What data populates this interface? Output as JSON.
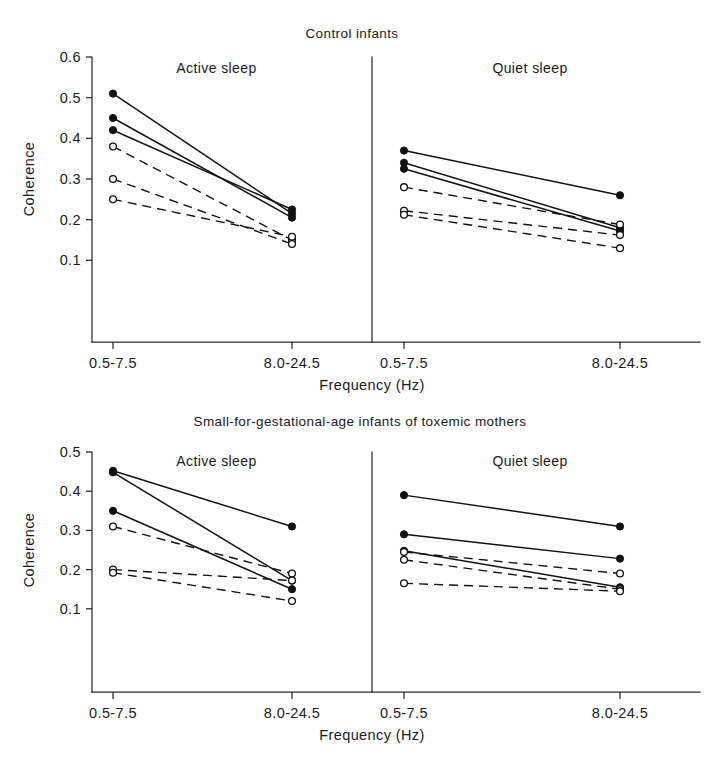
{
  "figure": {
    "axis_y_label": "Coherence",
    "axis_x_label": "Frequency (Hz)",
    "x_categories": [
      "0.5-7.5",
      "8.0-24.5"
    ],
    "caption": ""
  },
  "charts": [
    {
      "id": "control",
      "title": "Control infants",
      "panels": [
        {
          "id": "control-active",
          "title": "Active sleep"
        },
        {
          "id": "control-quiet",
          "title": "Quiet sleep"
        }
      ],
      "y_ticks": [
        "0.6",
        "0.5",
        "0.4",
        "0.3",
        "0.2",
        "0.1"
      ]
    },
    {
      "id": "sga",
      "title": "Small-for-gestational-age infants of toxemic mothers",
      "panels": [
        {
          "id": "sga-active",
          "title": "Active sleep"
        },
        {
          "id": "sga-quiet",
          "title": "Quiet sleep"
        }
      ],
      "y_ticks": [
        "0.5",
        "0.4",
        "0.3",
        "0.2",
        "0.1"
      ]
    }
  ],
  "chart_data": [
    {
      "type": "line",
      "id": "control-active",
      "title": "Control infants — Active sleep",
      "xlabel": "Frequency (Hz)",
      "ylabel": "Coherence",
      "x": [
        "0.5-7.5",
        "8.0-24.5"
      ],
      "ylim": [
        0.0,
        0.6
      ],
      "yticks": [
        0.1,
        0.2,
        0.3,
        0.4,
        0.5,
        0.6
      ],
      "grid": false,
      "legend": "none",
      "series": [
        {
          "name": "filled-1",
          "marker": "filled",
          "line": "solid",
          "values": [
            0.51,
            0.215
          ]
        },
        {
          "name": "filled-2",
          "marker": "filled",
          "line": "solid",
          "values": [
            0.45,
            0.205
          ]
        },
        {
          "name": "filled-3",
          "marker": "filled",
          "line": "solid",
          "values": [
            0.42,
            0.225
          ]
        },
        {
          "name": "open-1",
          "marker": "open",
          "line": "dashed",
          "values": [
            0.38,
            0.15
          ]
        },
        {
          "name": "open-2",
          "marker": "open",
          "line": "dashed",
          "values": [
            0.3,
            0.14
          ]
        },
        {
          "name": "open-3",
          "marker": "open",
          "line": "dashed",
          "values": [
            0.25,
            0.158
          ]
        }
      ]
    },
    {
      "type": "line",
      "id": "control-quiet",
      "title": "Control infants — Quiet sleep",
      "xlabel": "Frequency (Hz)",
      "ylabel": "Coherence",
      "x": [
        "0.5-7.5",
        "8.0-24.5"
      ],
      "ylim": [
        0.0,
        0.6
      ],
      "yticks": [
        0.1,
        0.2,
        0.3,
        0.4,
        0.5,
        0.6
      ],
      "grid": false,
      "legend": "none",
      "series": [
        {
          "name": "filled-1",
          "marker": "filled",
          "line": "solid",
          "values": [
            0.37,
            0.26
          ]
        },
        {
          "name": "filled-2",
          "marker": "filled",
          "line": "solid",
          "values": [
            0.34,
            0.18
          ]
        },
        {
          "name": "filled-3",
          "marker": "filled",
          "line": "solid",
          "values": [
            0.325,
            0.172
          ]
        },
        {
          "name": "open-1",
          "marker": "open",
          "line": "dashed",
          "values": [
            0.28,
            0.188
          ]
        },
        {
          "name": "open-2",
          "marker": "open",
          "line": "dashed",
          "values": [
            0.222,
            0.162
          ]
        },
        {
          "name": "open-3",
          "marker": "open",
          "line": "dashed",
          "values": [
            0.212,
            0.13
          ]
        }
      ]
    },
    {
      "type": "line",
      "id": "sga-active",
      "title": "Small-for-gestational-age infants of toxemic mothers — Active sleep",
      "xlabel": "Frequency (Hz)",
      "ylabel": "Coherence",
      "x": [
        "0.5-7.5",
        "8.0-24.5"
      ],
      "ylim": [
        0.0,
        0.5
      ],
      "yticks": [
        0.1,
        0.2,
        0.3,
        0.4,
        0.5
      ],
      "grid": false,
      "legend": "none",
      "series": [
        {
          "name": "filled-1",
          "marker": "filled",
          "line": "solid",
          "values": [
            0.452,
            0.31
          ]
        },
        {
          "name": "filled-2",
          "marker": "filled",
          "line": "solid",
          "values": [
            0.448,
            0.172
          ]
        },
        {
          "name": "filled-3",
          "marker": "filled",
          "line": "solid",
          "values": [
            0.35,
            0.15
          ]
        },
        {
          "name": "open-1",
          "marker": "open",
          "line": "dashed",
          "values": [
            0.31,
            0.19
          ]
        },
        {
          "name": "open-2",
          "marker": "open",
          "line": "dashed",
          "values": [
            0.2,
            0.172
          ]
        },
        {
          "name": "open-3",
          "marker": "open",
          "line": "dashed",
          "values": [
            0.192,
            0.12
          ]
        }
      ]
    },
    {
      "type": "line",
      "id": "sga-quiet",
      "title": "Small-for-gestational-age infants of toxemic mothers — Quiet sleep",
      "xlabel": "Frequency (Hz)",
      "ylabel": "Coherence",
      "x": [
        "0.5-7.5",
        "8.0-24.5"
      ],
      "ylim": [
        0.0,
        0.5
      ],
      "yticks": [
        0.1,
        0.2,
        0.3,
        0.4,
        0.5
      ],
      "grid": false,
      "legend": "none",
      "series": [
        {
          "name": "filled-1",
          "marker": "filled",
          "line": "solid",
          "values": [
            0.39,
            0.31
          ]
        },
        {
          "name": "filled-2",
          "marker": "filled",
          "line": "solid",
          "values": [
            0.29,
            0.228
          ]
        },
        {
          "name": "filled-3",
          "marker": "filled",
          "line": "solid",
          "values": [
            0.248,
            0.155
          ]
        },
        {
          "name": "open-1",
          "marker": "open",
          "line": "dashed",
          "values": [
            0.245,
            0.19
          ]
        },
        {
          "name": "open-2",
          "marker": "open",
          "line": "dashed",
          "values": [
            0.225,
            0.15
          ]
        },
        {
          "name": "open-3",
          "marker": "open",
          "line": "dashed",
          "values": [
            0.165,
            0.145
          ]
        }
      ]
    }
  ]
}
